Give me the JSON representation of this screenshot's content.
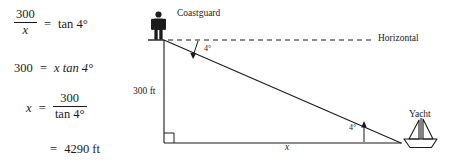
{
  "work": {
    "equations": [
      {
        "id": "eq1",
        "type": "fraction_equation",
        "numerator": "300",
        "denominator": "x",
        "relation": "=",
        "right": "tan 4°",
        "text": "300/x = tan 4°"
      },
      {
        "id": "eq2",
        "type": "linear",
        "left": "300",
        "relation": "=",
        "right": "x tan 4°",
        "text": "300 = x tan 4°"
      },
      {
        "id": "eq3",
        "type": "fraction_solution",
        "left": "x",
        "relation": "=",
        "numerator": "300",
        "denominator": "tan 4°",
        "text": "x = 300 / tan 4°"
      },
      {
        "id": "eq4",
        "type": "result",
        "relation": "=",
        "right": "4290 ft",
        "text": "= 4290 ft"
      }
    ]
  },
  "diagram": {
    "labels": {
      "coastguard": "Coastguard",
      "horizontal": "Horizontal",
      "angle_top": "4°",
      "height": "300 ft",
      "yacht": "Yacht",
      "angle_bottom": "4°",
      "base": "x"
    },
    "icons": {
      "person": "person-icon",
      "boat": "sailboat-icon"
    },
    "geometry": {
      "cliff_top": [
        24,
        40
      ],
      "cliff_base": [
        24,
        143
      ],
      "yacht_point": [
        260,
        143
      ],
      "horizontal_dashed_end": [
        232,
        40
      ],
      "right_angle_marker": true,
      "depression_angle_degrees": 4,
      "elevation_angle_degrees": 4
    },
    "colors": {
      "line": "#1b1b1b",
      "background": "#ffffff"
    }
  }
}
